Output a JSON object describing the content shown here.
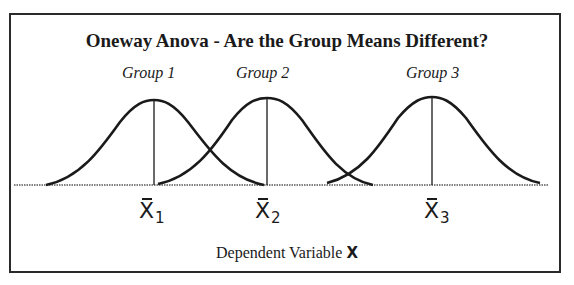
{
  "title": "Oneway Anova - Are the Group Means Different?",
  "groups": [
    {
      "label": "Group 1",
      "mean_symbol": "X",
      "subscript": "1"
    },
    {
      "label": "Group 2",
      "mean_symbol": "X",
      "subscript": "2"
    },
    {
      "label": "Group 3",
      "mean_symbol": "X",
      "subscript": "3"
    }
  ],
  "x_axis": {
    "label_prefix": "Dependent Variable",
    "label_var": "X"
  },
  "colors": {
    "line": "#1a1a1a",
    "frame": "#2a2a2a",
    "baseline": "#555555"
  }
}
